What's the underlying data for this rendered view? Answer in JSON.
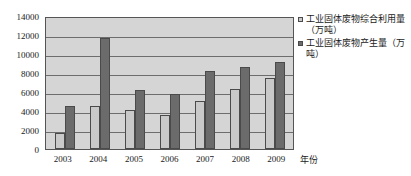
{
  "chart_data": {
    "type": "bar",
    "title": "",
    "subtitle": "",
    "xlabel": "年份",
    "ylabel": "",
    "categories": [
      "2003",
      "2004",
      "2005",
      "2006",
      "2007",
      "2008",
      "2009"
    ],
    "series": [
      {
        "name": "工业固体废物综合利用量（万吨）",
        "color": "#c9c9c9",
        "values": [
          1700,
          4550,
          4150,
          3600,
          5100,
          6350,
          7450
        ]
      },
      {
        "name": "工业固体废物产生量（万吨）",
        "color": "#6b6b6b",
        "values": [
          4550,
          11700,
          6250,
          5750,
          8200,
          8650,
          9200
        ]
      }
    ],
    "ylim": [
      0,
      14000
    ],
    "yticks": [
      0,
      2000,
      4000,
      6000,
      8000,
      10000,
      12000,
      14000
    ],
    "ytick_labels": [
      "0",
      "2000",
      "4000",
      "6000",
      "8000",
      "10000",
      "12000",
      "14000"
    ],
    "grid": true,
    "grid_axis": "y",
    "legend_position": "right",
    "plot_background": "#d5d5d5",
    "border_color": "#555555",
    "gridline_color": "#6d6d6d"
  },
  "legend": {
    "entries": [
      {
        "label": "工业固体废物综合利用量（万吨）",
        "marker": "square-swatch-light"
      },
      {
        "label": "工业固体废物产生量（万吨）",
        "marker": "square-swatch-dark"
      }
    ]
  },
  "axis": {
    "x_title": "年份"
  }
}
